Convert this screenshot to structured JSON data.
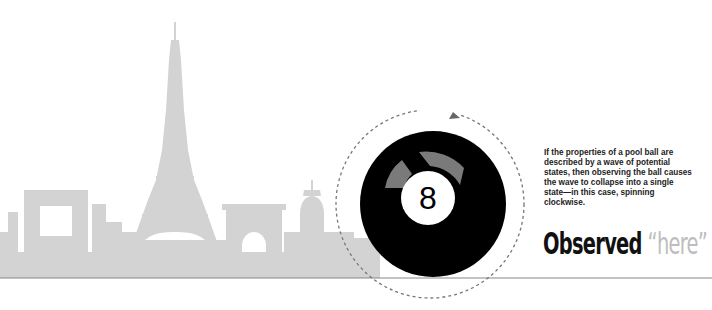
{
  "illustration": {
    "subject": "Paris skyline silhouette with pool ball",
    "skyline_color": "#d3d3d3",
    "baseline_color": "#888888",
    "ball": {
      "number_label": "8",
      "ball_color": "#000000",
      "number_circle_color": "#ffffff",
      "spin_arrow_color": "#7a7a7a",
      "spin_direction": "clockwise"
    },
    "orbit": {
      "style": "dashed",
      "color": "#777777",
      "arrow_color": "#666666"
    }
  },
  "caption": {
    "text": "If the properties of a pool ball are described by a wave of potential states, then observing the ball causes the wave to collapse into a single state—in this case, spinning clockwise."
  },
  "headline": {
    "primary": "Observed",
    "secondary": "“here”",
    "primary_color": "#111111",
    "secondary_color": "#bdbdbd"
  }
}
